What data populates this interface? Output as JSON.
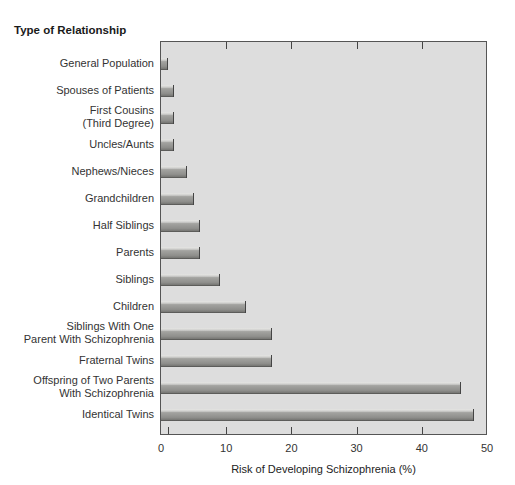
{
  "chart_data": {
    "type": "bar",
    "orientation": "horizontal",
    "title": "Type of Relationship",
    "xlabel": "Risk of Developing Schizophrenia (%)",
    "ylabel": "Type of Relationship",
    "xlim": [
      0,
      50
    ],
    "xticks": [
      0,
      10,
      20,
      30,
      40,
      50
    ],
    "grid": false,
    "legend": null,
    "categories": [
      "General Population",
      "Spouses of Patients",
      "First Cousins\n(Third Degree)",
      "Uncles/Aunts",
      "Nephews/Nieces",
      "Grandchildren",
      "Half Siblings",
      "Parents",
      "Siblings",
      "Children",
      "Siblings With One\nParent With Schizophrenia",
      "Fraternal Twins",
      "Offspring of Two Parents\nWith Schizophrenia",
      "Identical Twins"
    ],
    "values": [
      1,
      2,
      2,
      2,
      4,
      5,
      6,
      6,
      9,
      13,
      17,
      17,
      46,
      48
    ],
    "bar_color": "#8f8f8c",
    "plot_background": "#dddddd"
  },
  "labels": {
    "title": "Type of Relationship",
    "xlabel": "Risk of Developing Schizophrenia (%)",
    "xticks": [
      "0",
      "10",
      "20",
      "30",
      "40",
      "50"
    ]
  }
}
